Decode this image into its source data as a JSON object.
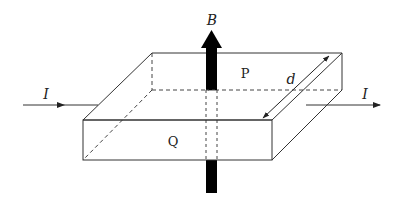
{
  "diagram": {
    "labels": {
      "magnetic_field": "B",
      "current_in": "I",
      "current_out": "I",
      "top_face": "P",
      "front_face": "Q",
      "width": "d"
    },
    "colors": {
      "line": "#333333",
      "arrow_fill": "#000000",
      "background": "#ffffff"
    }
  }
}
